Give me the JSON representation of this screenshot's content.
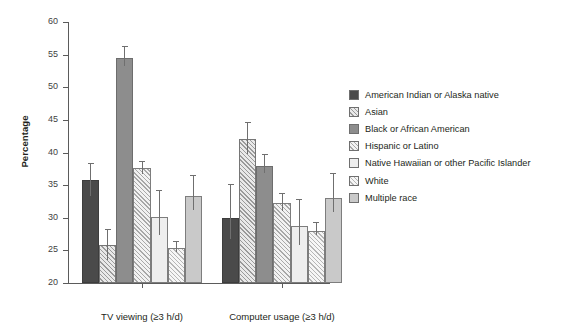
{
  "chart_data": {
    "type": "bar",
    "title": "",
    "subtitle": "",
    "xlabel": "",
    "ylabel": "Percentage",
    "ylim": [
      20,
      60
    ],
    "ytick_step": 5,
    "yticks": [
      20,
      25,
      30,
      35,
      40,
      45,
      50,
      55,
      60
    ],
    "ytick_labels": [
      "20",
      "25",
      "30",
      "35",
      "40",
      "45",
      "50",
      "55",
      "60"
    ],
    "grid": false,
    "legend_position": "right",
    "error_bars": "asymmetric caps shown above and below bar top",
    "categories": [
      "TV viewing (≥3 h/d)",
      "Computer usage (≥3 h/d)"
    ],
    "series": [
      {
        "name": "American Indian or Alaska native",
        "fill": "f-dark",
        "color": "#4a4a4a",
        "values": [
          35.8,
          30.0
        ],
        "err_low": [
          2.4,
          3.2
        ],
        "err_high": [
          2.6,
          5.2
        ]
      },
      {
        "name": "Asian",
        "fill": "f-hatch",
        "color": "#e9e9e9",
        "values": [
          25.8,
          42.0
        ],
        "err_low": [
          2.3,
          2.3
        ],
        "err_high": [
          2.4,
          2.7
        ]
      },
      {
        "name": "Black or African American",
        "fill": "f-med",
        "color": "#8d8d8d",
        "values": [
          54.5,
          38.0
        ],
        "err_low": [
          1.2,
          1.2
        ],
        "err_high": [
          1.8,
          1.7
        ]
      },
      {
        "name": "Hispanic or Latino",
        "fill": "f-hatch2",
        "color": "#f2f2f2",
        "values": [
          37.6,
          32.3
        ],
        "err_low": [
          0.9,
          1.2
        ],
        "err_high": [
          1.1,
          1.5
        ]
      },
      {
        "name": "Native Hawaiian or other Pacific Islander",
        "fill": "f-vlight",
        "color": "#eeeeee",
        "values": [
          30.1,
          28.8
        ],
        "err_low": [
          2.8,
          3.0
        ],
        "err_high": [
          4.2,
          4.0
        ]
      },
      {
        "name": "White",
        "fill": "f-hatch3",
        "color": "#f6f6f6",
        "values": [
          25.3,
          27.9
        ],
        "err_low": [
          0.6,
          0.5
        ],
        "err_high": [
          1.1,
          1.4
        ]
      },
      {
        "name": "Multiple race",
        "fill": "f-light",
        "color": "#c9c9c9",
        "values": [
          33.3,
          33.1
        ],
        "err_low": [
          2.1,
          2.2
        ],
        "err_high": [
          3.3,
          3.7
        ]
      }
    ]
  },
  "axis": {
    "y_title": "Percentage"
  }
}
